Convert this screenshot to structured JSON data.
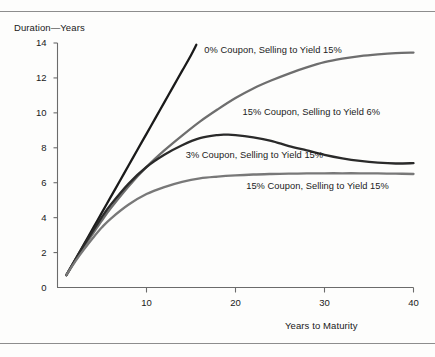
{
  "chart_data": {
    "type": "line",
    "title": "",
    "xlabel": "Years to Maturity",
    "ylabel": "Duration—Years",
    "xlim": [
      0,
      40
    ],
    "ylim": [
      0,
      14
    ],
    "xticks": [
      10,
      20,
      30,
      40
    ],
    "yticks": [
      0,
      2,
      4,
      6,
      8,
      10,
      12,
      14
    ],
    "grid": false,
    "legend_position": "inline-annotations",
    "series": [
      {
        "name": "0% Coupon, Selling to Yield 15%",
        "color": "#1a1a1a",
        "label_x": 16.5,
        "label_y": 13.55,
        "x": [
          1,
          2,
          3,
          4,
          5,
          6,
          7,
          8,
          9,
          10,
          11,
          12,
          13,
          14,
          15,
          15.6
        ],
        "y": [
          0.7,
          1.6,
          2.5,
          3.4,
          4.3,
          5.2,
          6.1,
          7.0,
          7.9,
          8.8,
          9.7,
          10.6,
          11.5,
          12.4,
          13.3,
          13.9
        ]
      },
      {
        "name": "15% Coupon, Selling to Yield 6%",
        "color": "#6e6e6e",
        "label_x": 20.8,
        "label_y": 10.0,
        "x": [
          1,
          2,
          3,
          4,
          5,
          6,
          8,
          10,
          12,
          14,
          16,
          18,
          20,
          22,
          24,
          26,
          28,
          30,
          32,
          34,
          36,
          38,
          40
        ],
        "y": [
          0.72,
          1.55,
          2.35,
          3.1,
          3.85,
          4.55,
          5.8,
          6.9,
          7.85,
          8.7,
          9.5,
          10.2,
          10.85,
          11.4,
          11.85,
          12.25,
          12.6,
          12.9,
          13.1,
          13.25,
          13.35,
          13.42,
          13.45
        ]
      },
      {
        "name": "3% Coupon, Selling to Yield 15%",
        "color": "#2a2a2a",
        "label_x": 14.4,
        "label_y": 7.55,
        "x": [
          1,
          2,
          3,
          4,
          5,
          6,
          8,
          10,
          12,
          14,
          16,
          18,
          19,
          20,
          22,
          24,
          26,
          28,
          30,
          32,
          34,
          36,
          38,
          40
        ],
        "y": [
          0.72,
          1.6,
          2.45,
          3.25,
          4.05,
          4.75,
          5.95,
          6.9,
          7.6,
          8.15,
          8.55,
          8.73,
          8.75,
          8.73,
          8.6,
          8.4,
          8.1,
          7.85,
          7.6,
          7.4,
          7.25,
          7.15,
          7.1,
          7.12
        ]
      },
      {
        "name": "15% Coupon, Selling to Yield 15%",
        "color": "#787878",
        "label_x": 21.2,
        "label_y": 5.75,
        "x": [
          1,
          2,
          3,
          4,
          5,
          6,
          8,
          10,
          12,
          14,
          16,
          18,
          20,
          22,
          24,
          26,
          28,
          30,
          32,
          34,
          36,
          38,
          40
        ],
        "y": [
          0.72,
          1.5,
          2.2,
          2.85,
          3.45,
          3.95,
          4.75,
          5.35,
          5.75,
          6.05,
          6.25,
          6.35,
          6.42,
          6.47,
          6.5,
          6.52,
          6.53,
          6.54,
          6.54,
          6.54,
          6.53,
          6.52,
          6.5
        ]
      }
    ]
  },
  "axes": {
    "y_title": "Duration—Years",
    "x_title": "Years to Maturity",
    "y_tick_labels": [
      "14",
      "12",
      "10",
      "8",
      "6",
      "4",
      "2",
      "0"
    ],
    "x_tick_labels": [
      "10",
      "20",
      "30",
      "40"
    ]
  },
  "colors": {
    "axis": "#6b6b6b",
    "rule": "#8d8d8d",
    "text": "#202020",
    "background": "#fdfdfc"
  }
}
